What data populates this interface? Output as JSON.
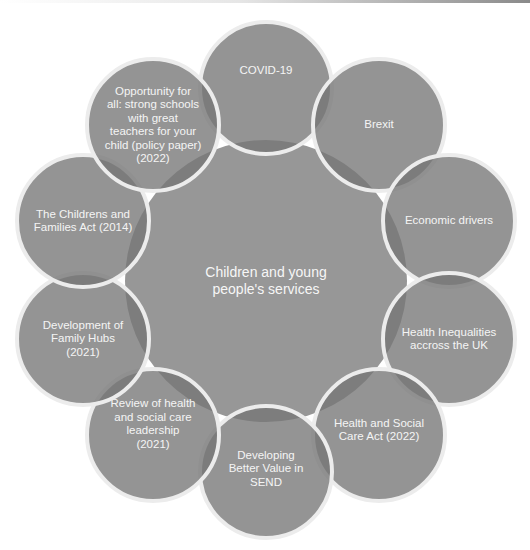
{
  "diagram": {
    "type": "radial-cycle",
    "center": {
      "label": "Children and young\npeople's services"
    },
    "nodes": [
      {
        "label": "COVID-19"
      },
      {
        "label": "Brexit"
      },
      {
        "label": "Economic drivers"
      },
      {
        "label": "Health Inequalities\naccross the UK"
      },
      {
        "label": "Health and Social\nCare Act (2022)"
      },
      {
        "label": "Developing\nBetter Value in\nSEND"
      },
      {
        "label": "Review of health\nand social care\nleadership\n(2021)"
      },
      {
        "label": "Development of\nFamily Hubs\n(2021)"
      },
      {
        "label": "The Childrens and\nFamilies Act (2014)"
      },
      {
        "label": "Opportunity for\nall: strong schools\nwith great\nteachers for your\nchild (policy paper)\n(2022)"
      }
    ],
    "colors": {
      "node_fill": "#8e8e8e",
      "overlap_fill": "#767676",
      "center_fill": "#979797",
      "node_border": "#ececec",
      "text": "#f4f4f4"
    }
  }
}
